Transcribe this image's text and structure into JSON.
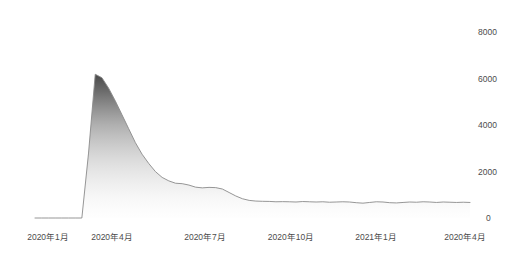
{
  "chart_data": {
    "type": "area",
    "title": "",
    "subtitle": "",
    "xlabel": "",
    "ylabel": "",
    "grid": false,
    "legend": false,
    "y_axis_position": "right",
    "ylim": [
      0,
      8000
    ],
    "y_ticks": [
      0,
      2000,
      4000,
      6000,
      8000
    ],
    "y_tick_labels": [
      "0",
      "2000",
      "4000",
      "6000",
      "8000"
    ],
    "x_tick_labels": [
      "2020年1月",
      "2020年4月",
      "2020年7月",
      "2020年10月",
      "2021年1月",
      "2020年4月"
    ],
    "series": [
      {
        "name": "",
        "fill_top_color": "#4a4a4a",
        "fill_bottom_color": "#ffffff",
        "line_color": "#8a8a8a",
        "x": [
          "2020-01-01",
          "2020-01-15",
          "2020-02-01",
          "2020-02-15",
          "2020-03-01",
          "2020-03-10",
          "2020-03-18",
          "2020-03-24",
          "2020-03-28",
          "2020-04-01",
          "2020-04-05",
          "2020-04-09",
          "2020-04-14",
          "2020-04-20",
          "2020-04-27",
          "2020-05-04",
          "2020-05-11",
          "2020-05-18",
          "2020-05-25",
          "2020-06-01",
          "2020-06-08",
          "2020-06-15",
          "2020-06-22",
          "2020-06-29",
          "2020-07-06",
          "2020-07-13",
          "2020-07-20",
          "2020-07-27",
          "2020-08-03",
          "2020-08-10",
          "2020-08-17",
          "2020-08-24",
          "2020-08-31",
          "2020-09-07",
          "2020-09-14",
          "2020-09-21",
          "2020-09-28",
          "2020-10-05",
          "2020-10-12",
          "2020-10-19",
          "2020-10-26",
          "2020-11-02",
          "2020-11-09",
          "2020-11-16",
          "2020-11-23",
          "2020-11-30",
          "2020-12-07",
          "2020-12-14",
          "2020-12-21",
          "2020-12-28",
          "2021-01-04",
          "2021-01-11",
          "2021-01-18",
          "2021-01-25",
          "2021-02-01",
          "2021-02-08",
          "2021-02-15",
          "2021-02-22",
          "2021-03-01",
          "2021-03-08",
          "2021-03-15",
          "2021-03-22",
          "2021-03-29",
          "2021-04-05",
          "2021-04-12",
          "2021-04-19"
        ],
        "values": [
          0,
          0,
          0,
          0,
          0,
          0,
          0,
          0,
          2800,
          6200,
          6050,
          5600,
          5050,
          4450,
          3850,
          3250,
          2750,
          2350,
          2000,
          1750,
          1600,
          1500,
          1480,
          1420,
          1330,
          1300,
          1320,
          1310,
          1250,
          1100,
          950,
          830,
          760,
          730,
          720,
          715,
          700,
          705,
          700,
          690,
          710,
          700,
          690,
          700,
          680,
          690,
          700,
          690,
          660,
          640,
          670,
          700,
          690,
          660,
          650,
          670,
          690,
          680,
          700,
          690,
          670,
          690,
          680,
          670,
          680,
          670
        ],
        "peak_value": 6200,
        "peak_label": "2020年4月"
      }
    ]
  }
}
